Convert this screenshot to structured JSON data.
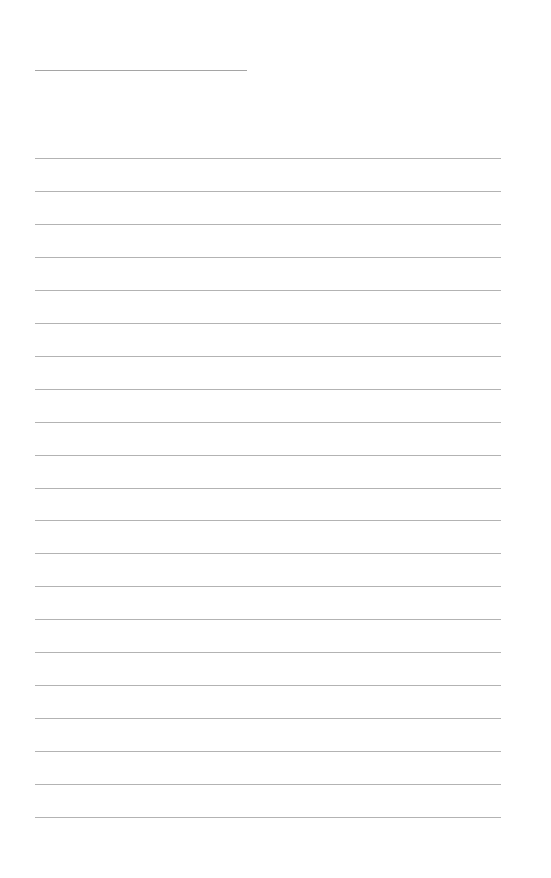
{
  "page": {
    "background": "#ffffff",
    "line_color": "#9a9a9a"
  },
  "title_line": {
    "x": 35,
    "y": 70,
    "width": 212
  },
  "ruled_lines": {
    "count": 21,
    "x": 35,
    "width": 466,
    "first_y": 158,
    "spacing": 32.95
  }
}
